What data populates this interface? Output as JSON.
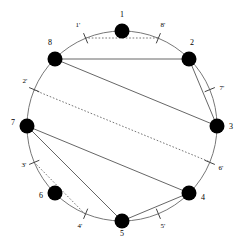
{
  "figure": {
    "type": "circle-chord-diagram",
    "background": "#ffffff",
    "stroke_color": "#555555",
    "node_color": "#000000",
    "circle": {
      "cx": 122,
      "cy": 126,
      "r": 95,
      "stroke": "#777777",
      "stroke_width": 1
    },
    "node_radius": 7.5,
    "tick_length": 11
  },
  "nodes": [
    {
      "id": "1",
      "label": "1",
      "angle_deg": -90,
      "x": 122,
      "y": 31,
      "label_x": 122,
      "label_y": 17,
      "label_anchor": "middle"
    },
    {
      "id": "2",
      "label": "2",
      "angle_deg": -45,
      "x": 189,
      "y": 59,
      "label_x": 192,
      "label_y": 45,
      "label_anchor": "middle"
    },
    {
      "id": "3",
      "label": "3",
      "angle_deg": 0,
      "x": 217,
      "y": 126,
      "label_x": 231,
      "label_y": 129,
      "label_anchor": "middle"
    },
    {
      "id": "4",
      "label": "4",
      "angle_deg": 45,
      "x": 189,
      "y": 193,
      "label_x": 203,
      "label_y": 200,
      "label_anchor": "middle"
    },
    {
      "id": "5",
      "label": "5",
      "angle_deg": 90,
      "x": 122,
      "y": 221,
      "label_x": 122,
      "label_y": 236,
      "label_anchor": "middle"
    },
    {
      "id": "6",
      "label": "6",
      "angle_deg": 135,
      "x": 55,
      "y": 193,
      "label_x": 41,
      "label_y": 198,
      "label_anchor": "middle"
    },
    {
      "id": "7",
      "label": "7",
      "angle_deg": 180,
      "x": 27,
      "y": 126,
      "label_x": 13,
      "label_y": 125,
      "label_anchor": "middle"
    },
    {
      "id": "8",
      "label": "8",
      "angle_deg": -135,
      "x": 55,
      "y": 59,
      "label_x": 50,
      "label_y": 45,
      "label_anchor": "middle"
    }
  ],
  "ticks": [
    {
      "id": "1p",
      "label": "1'",
      "angle_deg": -112.5,
      "x": 85,
      "y": 38,
      "label_x": 78,
      "label_y": 27,
      "label_anchor": "middle"
    },
    {
      "id": "2p",
      "label": "2'",
      "angle_deg": 202.5,
      "x": 34,
      "y": 90,
      "label_x": 25,
      "label_y": 83,
      "label_anchor": "middle"
    },
    {
      "id": "3p",
      "label": "3'",
      "angle_deg": 157.5,
      "x": 34,
      "y": 162,
      "label_x": 24,
      "label_y": 167,
      "label_anchor": "middle"
    },
    {
      "id": "4p",
      "label": "4'",
      "angle_deg": 112.5,
      "x": 85,
      "y": 214,
      "label_x": 80,
      "label_y": 228,
      "label_anchor": "middle"
    },
    {
      "id": "5p",
      "label": "5'",
      "angle_deg": 67.5,
      "x": 158,
      "y": 214,
      "label_x": 163,
      "label_y": 228,
      "label_anchor": "middle"
    },
    {
      "id": "6p",
      "label": "6'",
      "angle_deg": 22.5,
      "x": 210,
      "y": 162,
      "label_x": 221,
      "label_y": 170,
      "label_anchor": "middle"
    },
    {
      "id": "7p",
      "label": "7'",
      "angle_deg": -22.5,
      "x": 210,
      "y": 90,
      "label_x": 222,
      "label_y": 90,
      "label_anchor": "middle"
    },
    {
      "id": "8p",
      "label": "8'",
      "angle_deg": -67.5,
      "x": 158,
      "y": 38,
      "label_x": 163,
      "label_y": 27,
      "label_anchor": "middle"
    }
  ],
  "solid_chords": [
    {
      "id": "chord-8-2",
      "from": "8",
      "to": "2"
    },
    {
      "id": "chord-8-3",
      "from": "8",
      "to": "3"
    },
    {
      "id": "chord-2-3",
      "from": "2",
      "to": "3"
    },
    {
      "id": "chord-7-4",
      "from": "7",
      "to": "4"
    },
    {
      "id": "chord-7-5",
      "from": "7",
      "to": "5"
    },
    {
      "id": "chord-4-5",
      "from": "4",
      "to": "5"
    }
  ],
  "dotted_chords": [
    {
      "id": "dchord-1p-8p",
      "from": "1p",
      "to": "8p"
    },
    {
      "id": "dchord-2p-6p",
      "from": "2p",
      "to": "6p"
    },
    {
      "id": "dchord-3p-4p",
      "from": "3p",
      "to": "4p"
    }
  ]
}
